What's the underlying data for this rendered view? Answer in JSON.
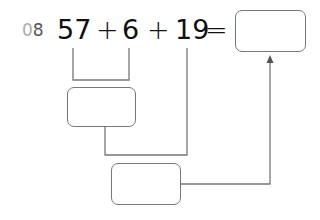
{
  "question": {
    "number_prefix": "0",
    "number_suffix": "8"
  },
  "equation": {
    "term1": "57",
    "op1": "+",
    "term2": "6",
    "op2": "+",
    "term3": "19",
    "equals": "="
  },
  "boxes": {
    "partial_sum": "",
    "total_sum": "",
    "answer": ""
  },
  "colors": {
    "text": "#111111",
    "question_number": "#555555",
    "line": "#777777"
  }
}
